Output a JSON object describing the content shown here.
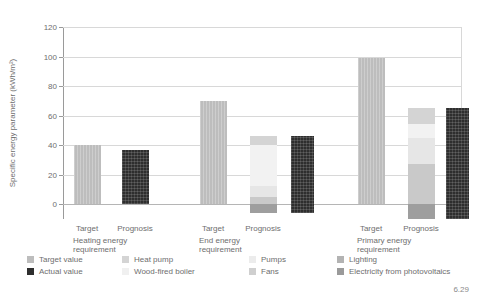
{
  "figure_number": "6.29",
  "chart_data": {
    "type": "bar",
    "title": "",
    "xlabel": "",
    "ylabel": "Specific energy parameter (kWh/m²)",
    "ylim": [
      -10,
      120
    ],
    "yticks": [
      0,
      20,
      40,
      60,
      80,
      100,
      120
    ],
    "ytick_labels": [
      "0",
      "20",
      "40",
      "60",
      "80",
      "100",
      "120"
    ],
    "grid": "horizontal",
    "legend_position": "below",
    "colors": {
      "target_value": "#bdbdbd",
      "actual_value": "#2e2e2e",
      "heat_pump": "#d4d4d4",
      "wood_fired_boiler": "#f2f2f2",
      "pumps": "#e6e6e6",
      "fans": "#c9c9c9",
      "lighting": "#b0b0b0",
      "electricity_from_photovoltaics": "#9e9e9e"
    },
    "groups": [
      {
        "title": "Heating energy",
        "title2": "requirement",
        "bars": [
          {
            "sub": "Target",
            "series": "Target value",
            "total": 40,
            "segments": [
              {
                "name": "Target value",
                "value": 40
              }
            ]
          },
          {
            "sub": "Prognosis",
            "series": "Actual value",
            "total": 37,
            "segments": [
              {
                "name": "Actual value",
                "value": 37
              }
            ]
          }
        ]
      },
      {
        "title": "End energy",
        "title2": "requirement",
        "bars": [
          {
            "sub": "Target",
            "series": "Target value",
            "total": 70,
            "segments": [
              {
                "name": "Target value",
                "value": 70
              }
            ]
          },
          {
            "sub": "Prognosis",
            "series": "Stacked",
            "total": 46,
            "segments": [
              {
                "name": "Heat pump",
                "value": 6
              },
              {
                "name": "Wood-fired boiler",
                "value": 28
              },
              {
                "name": "Pumps",
                "value": 7
              },
              {
                "name": "Fans",
                "value": 5
              },
              {
                "name": "Electricity from photovoltaics",
                "value": -6
              }
            ]
          },
          {
            "sub": "",
            "series": "Actual value",
            "total": 46,
            "segments": [
              {
                "name": "Actual value",
                "value": 46
              },
              {
                "name": "Actual value (negative)",
                "value": -6
              }
            ]
          }
        ]
      },
      {
        "title": "Primary energy",
        "title2": "requirement",
        "bars": [
          {
            "sub": "Target",
            "series": "Target value",
            "total": 99,
            "segments": [
              {
                "name": "Target value",
                "value": 99
              }
            ]
          },
          {
            "sub": "Prognosis",
            "series": "Stacked",
            "total": 65,
            "segments": [
              {
                "name": "Heat pump",
                "value": 11
              },
              {
                "name": "Wood-fired boiler",
                "value": 9
              },
              {
                "name": "Pumps",
                "value": 18
              },
              {
                "name": "Fans",
                "value": 27
              },
              {
                "name": "Electricity from photovoltaics",
                "value": -10
              }
            ]
          },
          {
            "sub": "",
            "series": "Actual value",
            "total": 65,
            "segments": [
              {
                "name": "Actual value",
                "value": 65
              },
              {
                "name": "Actual value (negative)",
                "value": -10
              }
            ]
          }
        ]
      }
    ]
  },
  "legend": {
    "columns": [
      {
        "items": [
          {
            "label": "Target value",
            "color": "#bdbdbd",
            "icon": "legend-swatch"
          },
          {
            "label": "Actual value",
            "color": "#2e2e2e",
            "icon": "legend-swatch"
          }
        ]
      },
      {
        "items": [
          {
            "label": "Heat pump",
            "color": "#d4d4d4",
            "icon": "legend-swatch"
          },
          {
            "label": "Wood-fired boiler",
            "color": "#f0f0f0",
            "icon": "legend-swatch"
          }
        ]
      },
      {
        "items": [
          {
            "label": "Pumps",
            "color": "#ececec",
            "icon": "legend-swatch"
          },
          {
            "label": "Fans",
            "color": "#cfcfcf",
            "icon": "legend-swatch"
          }
        ]
      },
      {
        "items": [
          {
            "label": "Lighting",
            "color": "#b3b3b3",
            "icon": "legend-swatch"
          },
          {
            "label": "Electricity from photovoltaics",
            "color": "#9a9a9a",
            "icon": "legend-swatch"
          }
        ]
      }
    ]
  }
}
